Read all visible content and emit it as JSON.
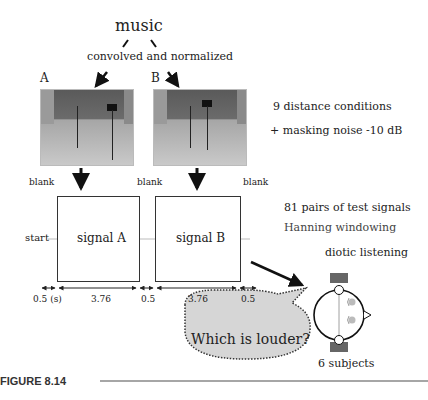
{
  "figure": {
    "source_label": "music",
    "process_label": "convolved and normalized",
    "photo_labels": [
      "A",
      "B"
    ],
    "right_notes": {
      "conditions": "9 distance conditions",
      "noise": "+ masking noise -10 dB",
      "pairs": "81 pairs of  test signals",
      "window": "Hanning windowing"
    },
    "timeline": {
      "blank_labels": [
        "blank",
        "blank",
        "blank"
      ],
      "start_label": "start",
      "signal_a": "signal A",
      "signal_b": "signal B",
      "durations": [
        "0.5 (s)",
        "3.76",
        "0.5",
        "3.76",
        "0.5"
      ]
    },
    "listening": {
      "mode": "diotic listening",
      "question": "Which is louder?",
      "subjects": "6 subjects"
    },
    "caption": "FIGURE 8.14"
  }
}
